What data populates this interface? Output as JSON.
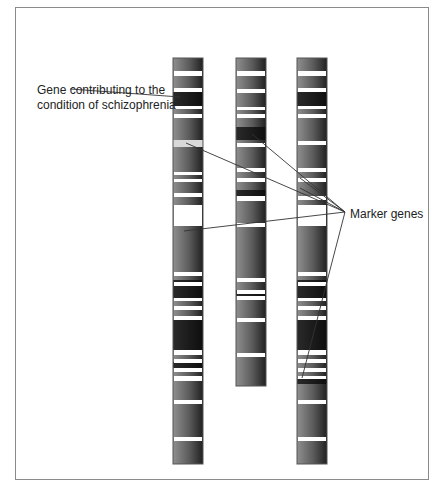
{
  "labels": {
    "gene": "Gene contributing to the\ncondition of schizophrenia",
    "marker": "Marker genes"
  },
  "colors": {
    "frame": "#8a8a8a",
    "band_light": "#9a9a9a",
    "band_dark": "#1e1e1e",
    "gap": "#ffffff",
    "pale_band": "#d8d8d8",
    "line": "#333333"
  },
  "chromosomes": [
    {
      "name": "chromosome-1",
      "x": 173,
      "width": 30,
      "top": 58,
      "bottom": 464,
      "white_bands": [
        [
          71,
          76
        ],
        [
          88,
          92
        ],
        [
          106,
          109
        ],
        [
          114,
          118
        ],
        [
          172,
          175
        ],
        [
          179,
          182
        ],
        [
          193,
          197
        ],
        [
          205,
          226
        ],
        [
          272,
          276
        ],
        [
          282,
          286
        ],
        [
          298,
          301
        ],
        [
          306,
          310
        ],
        [
          316,
          320
        ],
        [
          350,
          355
        ],
        [
          359,
          363
        ],
        [
          368,
          372
        ],
        [
          376,
          381
        ],
        [
          400,
          404
        ],
        [
          437,
          441
        ]
      ],
      "dark_regions": [
        [
          92,
          106
        ],
        [
          280,
          298
        ],
        [
          320,
          350
        ],
        [
          362,
          368
        ]
      ],
      "pale_bands": [
        [
          140,
          147
        ]
      ]
    },
    {
      "name": "chromosome-2",
      "x": 236,
      "width": 30,
      "top": 58,
      "bottom": 386,
      "white_bands": [
        [
          71,
          76
        ],
        [
          89,
          93
        ],
        [
          107,
          110
        ],
        [
          114,
          118
        ],
        [
          143,
          147
        ],
        [
          168,
          172
        ],
        [
          178,
          182
        ],
        [
          196,
          201
        ],
        [
          223,
          227
        ],
        [
          278,
          282
        ],
        [
          290,
          294
        ],
        [
          296,
          300
        ],
        [
          318,
          322
        ],
        [
          353,
          357
        ]
      ],
      "dark_regions": [
        [
          127,
          140
        ],
        [
          190,
          196
        ],
        [
          290,
          296
        ]
      ],
      "pale_bands": []
    },
    {
      "name": "chromosome-3",
      "x": 297,
      "width": 30,
      "top": 58,
      "bottom": 464,
      "white_bands": [
        [
          71,
          76
        ],
        [
          88,
          92
        ],
        [
          106,
          109
        ],
        [
          114,
          118
        ],
        [
          141,
          145
        ],
        [
          168,
          172
        ],
        [
          178,
          182
        ],
        [
          196,
          200
        ],
        [
          205,
          226
        ],
        [
          272,
          276
        ],
        [
          282,
          286
        ],
        [
          298,
          301
        ],
        [
          306,
          310
        ],
        [
          316,
          320
        ],
        [
          350,
          355
        ],
        [
          359,
          363
        ],
        [
          368,
          372
        ],
        [
          376,
          379
        ],
        [
          400,
          404
        ],
        [
          437,
          441
        ]
      ],
      "dark_regions": [
        [
          92,
          106
        ],
        [
          280,
          298
        ],
        [
          320,
          350
        ],
        [
          379,
          384
        ]
      ],
      "pale_bands": []
    }
  ],
  "pointers": {
    "gene": {
      "from": [
        70,
        89
      ],
      "to": [
        180,
        97
      ]
    },
    "markers_origin": [
      345,
      212
    ],
    "markers": [
      {
        "to": [
          186,
          143
        ]
      },
      {
        "to": [
          252,
          134
        ]
      },
      {
        "to": [
          184,
          231
        ]
      },
      {
        "to": [
          300,
          188
        ]
      },
      {
        "to": [
          300,
          178
        ]
      },
      {
        "to": [
          302,
          378
        ]
      }
    ]
  }
}
